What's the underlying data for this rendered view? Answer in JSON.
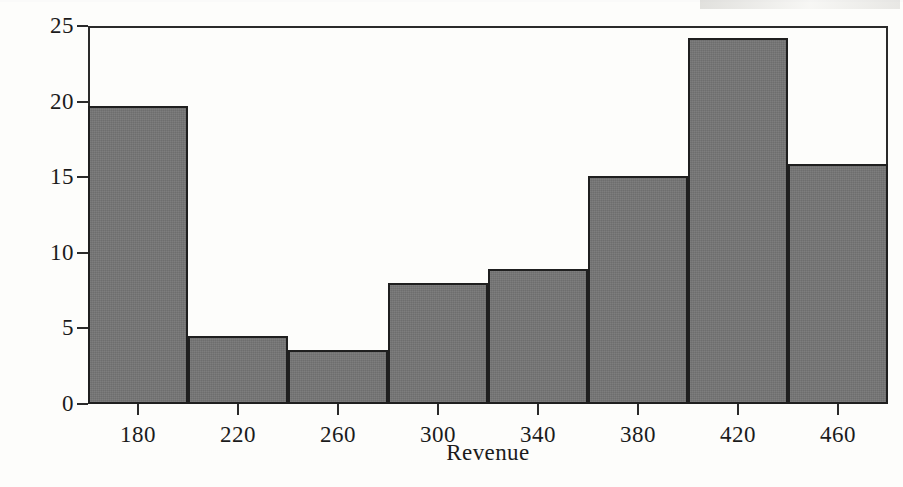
{
  "chart_data": {
    "type": "bar",
    "title": "",
    "subtitle": "",
    "xlabel": "Revenue",
    "ylabel": "Percent",
    "grid": false,
    "legend": null,
    "legend_position": "none",
    "xlim": [
      160,
      480
    ],
    "ylim": [
      0,
      25
    ],
    "bin_width": 40,
    "bin_edges": [
      160,
      200,
      240,
      280,
      320,
      360,
      400,
      440,
      480
    ],
    "x_tick_labels": [
      "180",
      "220",
      "260",
      "300",
      "340",
      "380",
      "420",
      "460"
    ],
    "x_tick_values": [
      180,
      220,
      260,
      300,
      340,
      380,
      420,
      460
    ],
    "y_tick_labels": [
      "0",
      "5",
      "10",
      "15",
      "20",
      "25"
    ],
    "y_tick_values": [
      0,
      5,
      10,
      15,
      20,
      25
    ],
    "categories": [
      "160-200",
      "200-240",
      "240-280",
      "280-320",
      "320-360",
      "360-400",
      "400-440",
      "440-480"
    ],
    "values": [
      19.7,
      4.5,
      3.6,
      8.0,
      8.9,
      15.1,
      24.2,
      15.9
    ],
    "bars": [
      {
        "label": "160-200",
        "center": 180,
        "value": 19.7
      },
      {
        "label": "200-240",
        "center": 220,
        "value": 4.5
      },
      {
        "label": "240-280",
        "center": 260,
        "value": 3.6
      },
      {
        "label": "280-320",
        "center": 300,
        "value": 8.0
      },
      {
        "label": "320-360",
        "center": 340,
        "value": 8.9
      },
      {
        "label": "360-400",
        "center": 380,
        "value": 15.1
      },
      {
        "label": "400-440",
        "center": 420,
        "value": 24.2
      },
      {
        "label": "440-480",
        "center": 460,
        "value": 15.9
      }
    ],
    "colors": {
      "bar_fill": "#757575",
      "bar_edge": "#1f1f1f",
      "axis": "#2a2a2a",
      "text": "#1b1b1b",
      "background": "#fdfdfb"
    }
  }
}
